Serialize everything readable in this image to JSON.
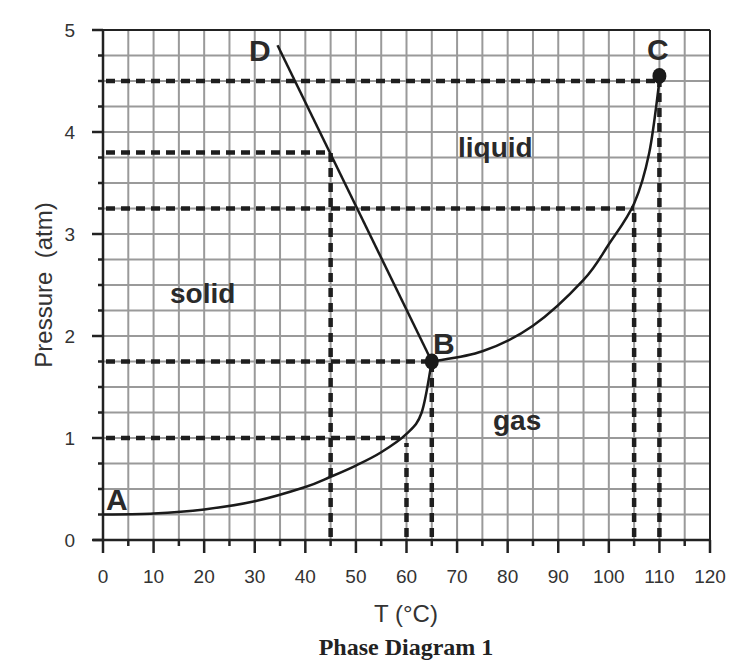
{
  "chart_data": {
    "type": "line",
    "title": "Phase Diagram 1",
    "xlabel": "T (°C)",
    "ylabel": "Pressure  (atm)",
    "xlim": [
      0,
      120
    ],
    "ylim": [
      0,
      5
    ],
    "x_ticks": [
      0,
      10,
      20,
      30,
      40,
      50,
      60,
      70,
      80,
      90,
      100,
      110,
      120
    ],
    "y_ticks": [
      0,
      1,
      2,
      3,
      4,
      5
    ],
    "grid": {
      "on": true,
      "x_step": 5,
      "y_step": 0.25
    },
    "regions": [
      {
        "label": "solid",
        "x": 14,
        "y": 2.4
      },
      {
        "label": "liquid",
        "x": 70,
        "y": 3.9
      },
      {
        "label": "gas",
        "x": 77,
        "y": 1.15
      }
    ],
    "points": [
      {
        "label": "A",
        "x": 0,
        "y": 0.25
      },
      {
        "label": "B",
        "x": 65,
        "y": 1.75,
        "marker": true
      },
      {
        "label": "C",
        "x": 110,
        "y": 4.55,
        "marker": true
      },
      {
        "label": "D",
        "x": 34.5,
        "y": 4.85
      }
    ],
    "series": [
      {
        "name": "sublimation curve A-B",
        "style": "solid",
        "x": [
          0,
          10,
          20,
          30,
          40,
          45,
          50,
          55,
          60,
          63,
          65
        ],
        "y": [
          0.25,
          0.26,
          0.3,
          0.38,
          0.52,
          0.62,
          0.73,
          0.86,
          1.04,
          1.25,
          1.75
        ]
      },
      {
        "name": "melting curve B-D",
        "style": "solid",
        "x": [
          65,
          34.5
        ],
        "y": [
          1.75,
          4.85
        ]
      },
      {
        "name": "vaporization curve B-C",
        "style": "solid",
        "x": [
          65,
          75,
          85,
          95,
          100,
          105,
          108,
          110
        ],
        "y": [
          1.75,
          1.85,
          2.1,
          2.55,
          2.9,
          3.3,
          3.8,
          4.5
        ]
      }
    ],
    "reference_lines": [
      {
        "orientation": "horizontal",
        "y": 4.5,
        "x_from": 0,
        "x_to": 110,
        "style": "dashed"
      },
      {
        "orientation": "horizontal",
        "y": 3.8,
        "x_from": 0,
        "x_to": 45,
        "style": "dashed"
      },
      {
        "orientation": "horizontal",
        "y": 3.25,
        "x_from": 0,
        "x_to": 105,
        "style": "dashed"
      },
      {
        "orientation": "horizontal",
        "y": 1.75,
        "x_from": 0,
        "x_to": 65,
        "style": "dashed"
      },
      {
        "orientation": "horizontal",
        "y": 1.0,
        "x_from": 0,
        "x_to": 60,
        "style": "dashed"
      },
      {
        "orientation": "vertical",
        "x": 45,
        "y_from": 0,
        "y_to": 3.8,
        "style": "dashed"
      },
      {
        "orientation": "vertical",
        "x": 60,
        "y_from": 0,
        "y_to": 0.95,
        "style": "dashed"
      },
      {
        "orientation": "vertical",
        "x": 65,
        "y_from": 0,
        "y_to": 1.75,
        "style": "dashed"
      },
      {
        "orientation": "vertical",
        "x": 105,
        "y_from": 0,
        "y_to": 3.25,
        "style": "dashed"
      },
      {
        "orientation": "vertical",
        "x": 110,
        "y_from": 0,
        "y_to": 4.5,
        "style": "dashed"
      }
    ]
  },
  "labels": {
    "title": "Phase Diagram 1",
    "xlabel": "T (°C)",
    "ylabel": "Pressure  (atm)",
    "x_ticks": [
      "0",
      "10",
      "20",
      "30",
      "40",
      "50",
      "60",
      "70",
      "80",
      "90",
      "100",
      "110",
      "120"
    ],
    "y_ticks": [
      "0",
      "1",
      "2",
      "3",
      "4",
      "5"
    ],
    "regions": {
      "solid": "solid",
      "liquid": "liquid",
      "gas": "gas"
    },
    "points": {
      "A": "A",
      "B": "B",
      "C": "C",
      "D": "D"
    }
  },
  "colors": {
    "grid": "#9a9a9a",
    "axis": "#222222",
    "curve": "#1a1a1a",
    "dashed": "#1e1e1e",
    "text": "#2a2a2a"
  }
}
